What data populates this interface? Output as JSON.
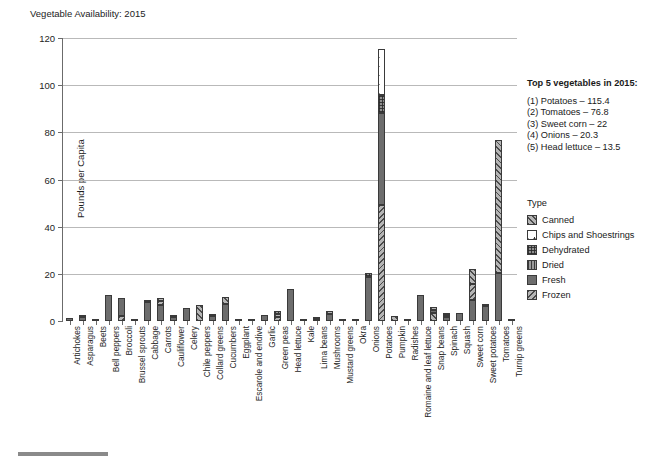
{
  "title": "Vegetable Availability: 2015",
  "chart_data": {
    "type": "bar",
    "title": "Vegetable Availability: 2015",
    "subtitle": "",
    "xlabel": "",
    "ylabel": "Pounds per Capita",
    "ylim": [
      0,
      120
    ],
    "yticks": [
      0,
      20,
      40,
      60,
      80,
      100,
      120
    ],
    "grid": true,
    "stacked": true,
    "legend_title": "Type",
    "legend_position": "right",
    "series": [
      {
        "name": "Canned",
        "pattern": "diagonal-forward-hatch"
      },
      {
        "name": "Chips and Shoestrings",
        "pattern": "dots"
      },
      {
        "name": "Dehydrated",
        "pattern": "fine-crosshatch"
      },
      {
        "name": "Dried",
        "pattern": "vertical-lines"
      },
      {
        "name": "Fresh",
        "pattern": "solid-gray"
      },
      {
        "name": "Frozen",
        "pattern": "diagonal-back-hatch"
      }
    ],
    "categories": [
      "Artichokes",
      "Asparagus",
      "Beets",
      "Bell peppers",
      "Broccoli",
      "Brussel sprouts",
      "Cabbage",
      "Carrots",
      "Cauliflower",
      "Celery",
      "Chile peppers",
      "Collard greens",
      "Cucumbers",
      "Eggplant",
      "Escarole and endive",
      "Garlic",
      "Green peas",
      "Head lettuce",
      "Kale",
      "Lima beans",
      "Mushrooms",
      "Mustard greens",
      "Okra",
      "Onions",
      "Potatoes",
      "Pumpkin",
      "Radishes",
      "Romaine and leaf lettuce",
      "Snap beans",
      "Spinach",
      "Squash",
      "Sweet corn",
      "Sweet potatoes",
      "Tomatoes",
      "Turnip greens"
    ],
    "bars": [
      {
        "category": "Artichokes",
        "total": 1.2,
        "segments": [
          {
            "type": "Fresh",
            "value": 1.2
          }
        ]
      },
      {
        "category": "Asparagus",
        "total": 1.7,
        "segments": [
          {
            "type": "Fresh",
            "value": 1.5
          },
          {
            "type": "Frozen",
            "value": 0.2
          }
        ]
      },
      {
        "category": "Beets",
        "total": 0.8,
        "segments": [
          {
            "type": "Canned",
            "value": 0.8
          }
        ]
      },
      {
        "category": "Bell peppers",
        "total": 11.2,
        "segments": [
          {
            "type": "Fresh",
            "value": 11.2
          }
        ]
      },
      {
        "category": "Broccoli",
        "total": 9.6,
        "segments": [
          {
            "type": "Frozen",
            "value": 2.3
          },
          {
            "type": "Fresh",
            "value": 7.3
          }
        ]
      },
      {
        "category": "Brussel sprouts",
        "total": 0.6,
        "segments": [
          {
            "type": "Fresh",
            "value": 0.6
          }
        ]
      },
      {
        "category": "Cabbage",
        "total": 8.6,
        "segments": [
          {
            "type": "Fresh",
            "value": 8.2
          },
          {
            "type": "Canned",
            "value": 0.4
          }
        ]
      },
      {
        "category": "Carrots",
        "total": 9.6,
        "segments": [
          {
            "type": "Fresh",
            "value": 6.8
          },
          {
            "type": "Frozen",
            "value": 1.8
          },
          {
            "type": "Canned",
            "value": 1.0
          }
        ]
      },
      {
        "category": "Cauliflower",
        "total": 2.3,
        "segments": [
          {
            "type": "Fresh",
            "value": 1.6
          },
          {
            "type": "Frozen",
            "value": 0.7
          }
        ]
      },
      {
        "category": "Celery",
        "total": 5.7,
        "segments": [
          {
            "type": "Fresh",
            "value": 5.7
          }
        ]
      },
      {
        "category": "Chile peppers",
        "total": 6.7,
        "segments": [
          {
            "type": "Canned",
            "value": 6.7
          }
        ]
      },
      {
        "category": "Collard greens",
        "total": 3.0,
        "segments": [
          {
            "type": "Fresh",
            "value": 2.1
          },
          {
            "type": "Frozen",
            "value": 0.9
          }
        ]
      },
      {
        "category": "Cucumbers",
        "total": 10.2,
        "segments": [
          {
            "type": "Fresh",
            "value": 7.3
          },
          {
            "type": "Canned",
            "value": 2.9
          }
        ]
      },
      {
        "category": "Eggplant",
        "total": 0.7,
        "segments": [
          {
            "type": "Fresh",
            "value": 0.7
          }
        ]
      },
      {
        "category": "Escarole and endive",
        "total": 0.2,
        "segments": [
          {
            "type": "Fresh",
            "value": 0.2
          }
        ]
      },
      {
        "category": "Garlic",
        "total": 2.5,
        "segments": [
          {
            "type": "Fresh",
            "value": 2.5
          }
        ]
      },
      {
        "category": "Green peas",
        "total": 4.1,
        "segments": [
          {
            "type": "Frozen",
            "value": 1.6
          },
          {
            "type": "Canned",
            "value": 1.4
          },
          {
            "type": "Dried",
            "value": 1.1
          }
        ]
      },
      {
        "category": "Head lettuce",
        "total": 13.5,
        "segments": [
          {
            "type": "Fresh",
            "value": 13.5
          }
        ]
      },
      {
        "category": "Kale",
        "total": 0.6,
        "segments": [
          {
            "type": "Fresh",
            "value": 0.6
          }
        ]
      },
      {
        "category": "Lima beans",
        "total": 1.2,
        "segments": [
          {
            "type": "Frozen",
            "value": 0.5
          },
          {
            "type": "Dried",
            "value": 0.7
          }
        ]
      },
      {
        "category": "Mushrooms",
        "total": 4.2,
        "segments": [
          {
            "type": "Fresh",
            "value": 3.0
          },
          {
            "type": "Canned",
            "value": 1.2
          }
        ]
      },
      {
        "category": "Mustard greens",
        "total": 0.5,
        "segments": [
          {
            "type": "Fresh",
            "value": 0.5
          }
        ]
      },
      {
        "category": "Okra",
        "total": 0.6,
        "segments": [
          {
            "type": "Frozen",
            "value": 0.6
          }
        ]
      },
      {
        "category": "Onions",
        "total": 20.3,
        "segments": [
          {
            "type": "Fresh",
            "value": 18.5
          },
          {
            "type": "Dehydrated",
            "value": 1.8
          }
        ]
      },
      {
        "category": "Potatoes",
        "total": 115.4,
        "segments": [
          {
            "type": "Frozen",
            "value": 49.0
          },
          {
            "type": "Fresh",
            "value": 39.0
          },
          {
            "type": "Dehydrated",
            "value": 8.0
          },
          {
            "type": "Chips and Shoestrings",
            "value": 19.4
          }
        ]
      },
      {
        "category": "Pumpkin",
        "total": 2.3,
        "segments": [
          {
            "type": "Canned",
            "value": 2.3
          }
        ]
      },
      {
        "category": "Radishes",
        "total": 0.4,
        "segments": [
          {
            "type": "Fresh",
            "value": 0.4
          }
        ]
      },
      {
        "category": "Romaine and leaf lettuce",
        "total": 10.9,
        "segments": [
          {
            "type": "Fresh",
            "value": 10.9
          }
        ]
      },
      {
        "category": "Snap beans",
        "total": 5.8,
        "segments": [
          {
            "type": "Canned",
            "value": 3.4
          },
          {
            "type": "Fresh",
            "value": 1.4
          },
          {
            "type": "Frozen",
            "value": 1.0
          }
        ]
      },
      {
        "category": "Spinach",
        "total": 3.2,
        "segments": [
          {
            "type": "Fresh",
            "value": 1.8
          },
          {
            "type": "Frozen",
            "value": 0.8
          },
          {
            "type": "Canned",
            "value": 0.6
          }
        ]
      },
      {
        "category": "Squash",
        "total": 3.6,
        "segments": [
          {
            "type": "Fresh",
            "value": 3.6
          }
        ]
      },
      {
        "category": "Sweet corn",
        "total": 22.0,
        "segments": [
          {
            "type": "Fresh",
            "value": 9.0
          },
          {
            "type": "Frozen",
            "value": 6.5
          },
          {
            "type": "Canned",
            "value": 6.5
          }
        ]
      },
      {
        "category": "Sweet potatoes",
        "total": 7.2,
        "segments": [
          {
            "type": "Fresh",
            "value": 6.3
          },
          {
            "type": "Canned",
            "value": 0.9
          }
        ]
      },
      {
        "category": "Tomatoes",
        "total": 76.8,
        "segments": [
          {
            "type": "Fresh",
            "value": 20.3
          },
          {
            "type": "Canned",
            "value": 56.5
          }
        ]
      },
      {
        "category": "Turnip greens",
        "total": 0.5,
        "segments": [
          {
            "type": "Fresh",
            "value": 0.5
          }
        ]
      }
    ]
  },
  "top5": {
    "heading": "Top 5 vegetables in 2015:",
    "items": [
      "(1) Potatoes – 115.4",
      "(2) Tomatoes – 76.8",
      "(3) Sweet corn – 22",
      "(4) Onions – 20.3",
      "(5) Head lettuce – 13.5"
    ]
  },
  "legend": {
    "title": "Type",
    "entries": [
      {
        "label": "Canned",
        "icon": "swatch-canned-icon"
      },
      {
        "label": "Chips and Shoestrings",
        "icon": "swatch-chips-icon"
      },
      {
        "label": "Dehydrated",
        "icon": "swatch-dehydrated-icon"
      },
      {
        "label": "Dried",
        "icon": "swatch-dried-icon"
      },
      {
        "label": "Fresh",
        "icon": "swatch-fresh-icon"
      },
      {
        "label": "Frozen",
        "icon": "swatch-frozen-icon"
      }
    ]
  }
}
